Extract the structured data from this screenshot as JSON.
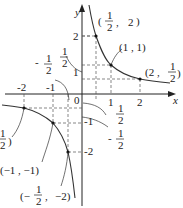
{
  "figure": {
    "function": "y = 1/x",
    "axes": {
      "x_label": "x",
      "y_label": "y",
      "origin_label": "0"
    },
    "x_ticks": [
      "-2",
      "-1",
      "1",
      "2"
    ],
    "y_ticks": [
      "2",
      "1",
      "-1",
      "-2"
    ],
    "fraction_ticks": {
      "x_neg_half": {
        "sign": "-",
        "num": "1",
        "den": "2"
      },
      "y_pos_half": {
        "num": "1",
        "den": "2"
      },
      "y_neg_half": {
        "sign": "-",
        "num": "1",
        "den": "2"
      },
      "x_pos_half": {
        "num": "1",
        "den": "2"
      }
    },
    "points": [
      {
        "label": "(1/2, 2)",
        "x": 0.5,
        "y": 2
      },
      {
        "label": "(1, 1)",
        "x": 1,
        "y": 1
      },
      {
        "label": "(2, 1/2)",
        "x": 2,
        "y": 0.5
      },
      {
        "label": "(-2, -1/2)",
        "x": -2,
        "y": -0.5
      },
      {
        "label": "(-1, -1)",
        "x": -1,
        "y": -1
      },
      {
        "label": "(-1/2, -2)",
        "x": -0.5,
        "y": -2
      }
    ],
    "point_labels": {
      "p1": {
        "open": "(",
        "num": "1",
        "den": "2",
        "sep": ",",
        "val": "2",
        "close": ")"
      },
      "p2": "(1 , 1)",
      "p3": {
        "open": "(2 ,",
        "num": "1",
        "den": "2",
        "close": ")"
      },
      "p4": {
        "num": "1",
        "den": "2",
        "close": ")"
      },
      "p5": "(−1 , −1)",
      "p6": {
        "open": "(−",
        "num": "1",
        "den": "2",
        "sep": ",",
        "val": "−2)"
      }
    },
    "colors": {
      "curve": "#333333",
      "axis": "#222222",
      "dashed": "#555555"
    }
  }
}
